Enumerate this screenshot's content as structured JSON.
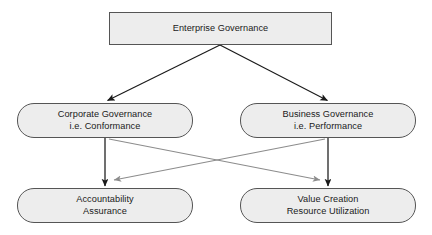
{
  "diagram": {
    "title": "Enterprise Governance",
    "type": "flow-diagram",
    "canvas": {
      "width": 432,
      "height": 235,
      "background": "#ffffff"
    },
    "style": {
      "node_fill": "#ededed",
      "node_border": "#555555",
      "text_color": "#1a1a1a",
      "primary_arrow_color": "#1a1a1a",
      "secondary_arrow_color": "#8c8c8c"
    },
    "nodes": [
      {
        "id": "enterprise",
        "shape": "rectangle",
        "lines": [
          "Enterprise Governance"
        ],
        "line1": "Enterprise Governance",
        "line2": ""
      },
      {
        "id": "corporate",
        "shape": "pill",
        "lines": [
          "Corporate Governance",
          "i.e. Conformance"
        ],
        "line1": "Corporate Governance",
        "line2": "i.e. Conformance"
      },
      {
        "id": "business",
        "shape": "pill",
        "lines": [
          "Business Governance",
          "i.e. Performance"
        ],
        "line1": "Business Governance",
        "line2": "i.e. Performance"
      },
      {
        "id": "accountability",
        "shape": "pill",
        "lines": [
          "Accountability",
          "Assurance"
        ],
        "line1": "Accountability",
        "line2": "Assurance"
      },
      {
        "id": "value",
        "shape": "pill",
        "lines": [
          "Value Creation",
          "Resource Utilization"
        ],
        "line1": "Value Creation",
        "line2": "Resource Utilization"
      }
    ],
    "edges": [
      {
        "id": "ent-to-corp",
        "from": "enterprise",
        "to": "corporate",
        "style": "solid-dark",
        "label": ""
      },
      {
        "id": "ent-to-bus",
        "from": "enterprise",
        "to": "business",
        "style": "solid-dark",
        "label": ""
      },
      {
        "id": "corp-to-acct",
        "from": "corporate",
        "to": "accountability",
        "style": "solid-dark",
        "label": ""
      },
      {
        "id": "bus-to-value",
        "from": "business",
        "to": "value",
        "style": "solid-dark",
        "label": ""
      },
      {
        "id": "corp-to-value",
        "from": "corporate",
        "to": "value",
        "style": "solid-gray",
        "label": ""
      },
      {
        "id": "bus-to-acct",
        "from": "business",
        "to": "accountability",
        "style": "solid-gray",
        "label": ""
      }
    ]
  }
}
